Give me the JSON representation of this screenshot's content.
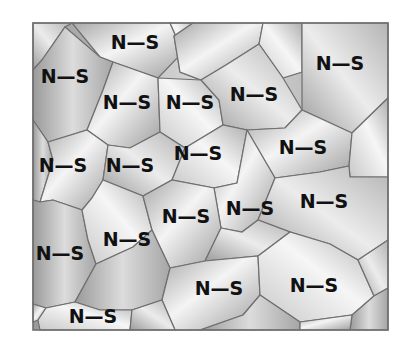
{
  "figure": {
    "frame": {
      "x": 33,
      "y": 23,
      "width": 355,
      "height": 307,
      "border_color": "#707070"
    },
    "label_text": "N—S",
    "labels": [
      {
        "text": "N—S",
        "x": 135,
        "y": 49
      },
      {
        "text": "N—S",
        "x": 65,
        "y": 83
      },
      {
        "text": "N—S",
        "x": 340,
        "y": 70
      },
      {
        "text": "N—S",
        "x": 127,
        "y": 109
      },
      {
        "text": "N—S",
        "x": 190,
        "y": 109
      },
      {
        "text": "N—S",
        "x": 254,
        "y": 101
      },
      {
        "text": "N—S",
        "x": 303,
        "y": 154
      },
      {
        "text": "N—S",
        "x": 63,
        "y": 172
      },
      {
        "text": "N—S",
        "x": 130,
        "y": 172
      },
      {
        "text": "N—S",
        "x": 198,
        "y": 160
      },
      {
        "text": "N—S",
        "x": 324,
        "y": 208
      },
      {
        "text": "N—S",
        "x": 186,
        "y": 223
      },
      {
        "text": "N—S",
        "x": 250,
        "y": 215
      },
      {
        "text": "N—S",
        "x": 127,
        "y": 246
      },
      {
        "text": "N—S",
        "x": 60,
        "y": 260
      },
      {
        "text": "N—S",
        "x": 219,
        "y": 295
      },
      {
        "text": "N—S",
        "x": 314,
        "y": 292
      },
      {
        "text": "N—S",
        "x": 93,
        "y": 323
      }
    ],
    "colors": {
      "light": "#f2f2f2",
      "mid": "#c4c4c4",
      "dark": "#9a9a9a",
      "boundary": "#6f6f6f",
      "text": "#111111"
    }
  }
}
